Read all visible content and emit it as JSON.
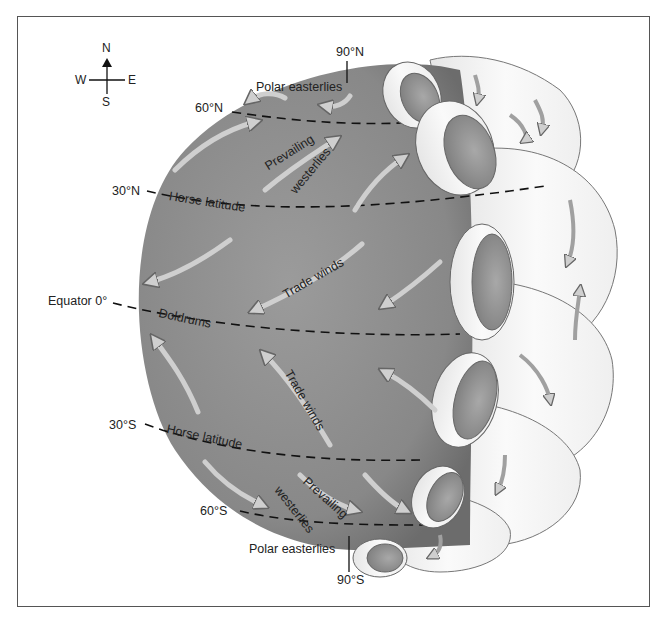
{
  "figure": {
    "colors": {
      "globe": "#8a8a8a",
      "globe_dark": "#6e6e6e",
      "cell_fill": "#f2f2f2",
      "cell_inner": "#9a9a9a",
      "arrow_fill": "#c8c8c8",
      "arrow_stroke": "#6a6a6a",
      "dash_line": "#111111",
      "frame": "#555555",
      "text": "#222222"
    }
  },
  "compass": {
    "north": "N",
    "south": "S",
    "east": "E",
    "west": "W"
  },
  "latitudes": {
    "n90": "90°N",
    "n60": "60°N",
    "n30": "30°N",
    "equator": "Equator 0°",
    "s30": "30°S",
    "s60": "60°S",
    "s90": "90°S"
  },
  "wind_belts": {
    "polar_easterlies_north": "Polar easterlies",
    "prevailing_north_1": "Prevailing",
    "prevailing_north_2": "westerlies",
    "horse_latitude_north": "Horse latitude",
    "trade_winds_north": "Trade winds",
    "doldrums": "Doldrums",
    "trade_winds_south": "Trade winds",
    "horse_latitude_south": "Horse latitude",
    "prevailing_south_1": "Prevailing",
    "prevailing_south_2": "westerlies",
    "polar_easterlies_south": "Polar easterlies"
  }
}
